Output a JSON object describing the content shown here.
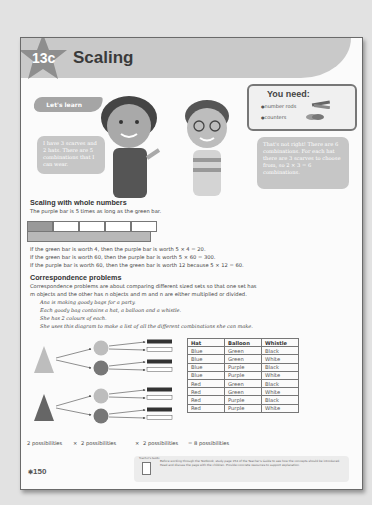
{
  "header": {
    "lesson_number": "13c",
    "title": "Scaling"
  },
  "lets_learn": {
    "label": "Let's learn"
  },
  "you_need": {
    "title": "You need:",
    "items": [
      "number rods",
      "counters"
    ]
  },
  "speech": {
    "left": "I have 3 scarves and 2 hats. There are 5 combinations that I can wear.",
    "right": "That's not right! There are 6 combinations. For each hat there are 3 scarves to choose from, so 2 × 3 = 6 combinations."
  },
  "scaling_section": {
    "heading": "Scaling with whole numbers",
    "intro": "The purple bar is 5 times as long as the green bar.",
    "bar_model": {
      "green_segments": 1,
      "total_segments": 5
    },
    "lines": [
      "If the green bar is worth 4, then the purple bar is worth 5 × 4 = 20.",
      "If the green bar is worth 60, then the purple bar is worth 5 × 60 = 300.",
      "If the purple bar is worth 60, then the green bar is worth 12 because 5 × 12 = 60."
    ]
  },
  "correspondence_section": {
    "heading": "Correspondence problems",
    "intro_lines": [
      "Correspondence problems are about comparing different sized sets so that one set has",
      "m objects and the other has n objects and m and n are either multiplied or divided."
    ],
    "story_lines": [
      "Ana is making goody bags for a party.",
      "Each goody bag contains a hat, a balloon and a whistle.",
      "She has 2 colours of each.",
      "She uses this diagram to make a list of all the different combinations she can make."
    ],
    "table": {
      "headers": [
        "Hat",
        "Balloon",
        "Whistle"
      ],
      "rows": [
        [
          "Blue",
          "Green",
          "Black"
        ],
        [
          "Blue",
          "Green",
          "White"
        ],
        [
          "Blue",
          "Purple",
          "Black"
        ],
        [
          "Blue",
          "Purple",
          "White"
        ],
        [
          "Red",
          "Green",
          "Black"
        ],
        [
          "Red",
          "Green",
          "White"
        ],
        [
          "Red",
          "Purple",
          "Black"
        ],
        [
          "Red",
          "Purple",
          "White"
        ]
      ]
    },
    "possibilities": {
      "p1": "2 possibilities",
      "x1": "×",
      "p2": "2 possibilities",
      "x2": "×",
      "p3": "2 possibilities",
      "result": "= 8 possibilities"
    }
  },
  "footer": {
    "teachers_guide_label": "Teacher's Guide",
    "note": "Before working through the Textbook, study page 154 of the Teacher's Guide to see how the concepts should be introduced. Read and discuss the page with the children. Provide concrete resources to support explanation.",
    "page_number": "150"
  }
}
